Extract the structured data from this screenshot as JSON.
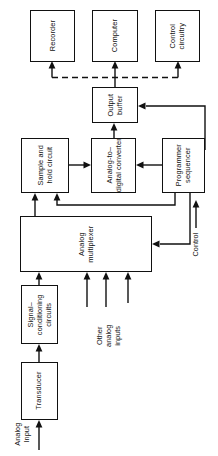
{
  "diagram": {
    "orientation": "rotated-90-ccw",
    "line_color": "#111111",
    "background_color": "#ffffff",
    "blocks": [
      {
        "id": "recorder",
        "label": "Recorder"
      },
      {
        "id": "computer",
        "label": "Computer"
      },
      {
        "id": "control-circuitry",
        "label": "Control\ncircuitry",
        "line1": "Control",
        "line2": "circuitry"
      },
      {
        "id": "output-buffer",
        "label": "Output\nbuffer",
        "line1": "Output",
        "line2": "buffer"
      },
      {
        "id": "sample-and-hold",
        "label": "Sample and\nhold circuit",
        "line1": "Sample and",
        "line2": "hold circuit"
      },
      {
        "id": "adc",
        "label": "Analog-to-\ndigital converter",
        "line1": "Analog-to–",
        "line2": "digital converter"
      },
      {
        "id": "programmer-sequencer",
        "label": "Programmer\nsequencer",
        "line1": "Programmer",
        "line2": "sequencer"
      },
      {
        "id": "analog-multiplexer",
        "label": "Analog\nmultiplexer",
        "line1": "Analog",
        "line2": "multiplexer"
      },
      {
        "id": "signal-conditioning",
        "label": "Signal-\nconditioning\ncircuits",
        "line1": "Signal–",
        "line2": "conditioning",
        "line3": "circuits"
      },
      {
        "id": "transducer",
        "label": "Transducer"
      }
    ],
    "labels": [
      {
        "id": "other-analog-inputs",
        "line1": "Other",
        "line2": "analog",
        "line3": "inputs"
      },
      {
        "id": "control-signal",
        "line1": "Control"
      },
      {
        "id": "analog-input",
        "line1": "Analog",
        "line2": "Input"
      }
    ]
  }
}
